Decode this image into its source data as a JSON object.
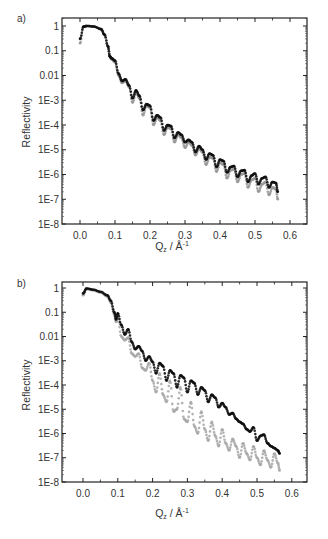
{
  "chart_data": [
    {
      "panel": "a)",
      "type": "scatter",
      "title": "",
      "xlabel": "Q_z / Å^-1",
      "ylabel": "Reflectivity",
      "yscale": "log",
      "xlim": [
        -0.05,
        0.65
      ],
      "ylim": [
        1e-08,
        1.6
      ],
      "x_ticks": [
        "0.0",
        "0.1",
        "0.2",
        "0.3",
        "0.4",
        "0.5",
        "0.6"
      ],
      "y_ticks": [
        "1",
        "0.1",
        "0.01",
        "1E-3",
        "1E-4",
        "1E-5",
        "1E-6",
        "1E-7",
        "1E-8"
      ],
      "grid": false,
      "legend": null,
      "series": [
        {
          "name": "dark series",
          "color": "#111111",
          "x": [
            0.0,
            0.01,
            0.02,
            0.04,
            0.06,
            0.07,
            0.08,
            0.085,
            0.09,
            0.1,
            0.11,
            0.12,
            0.13,
            0.14,
            0.15,
            0.16,
            0.17,
            0.18,
            0.19,
            0.2,
            0.21,
            0.22,
            0.23,
            0.24,
            0.25,
            0.26,
            0.27,
            0.28,
            0.29,
            0.3,
            0.31,
            0.32,
            0.33,
            0.34,
            0.35,
            0.36,
            0.37,
            0.38,
            0.39,
            0.4,
            0.41,
            0.42,
            0.43,
            0.44,
            0.45,
            0.46,
            0.47,
            0.48,
            0.49,
            0.5,
            0.51,
            0.52,
            0.53,
            0.54,
            0.55,
            0.56,
            0.565
          ],
          "y": [
            0.3,
            0.95,
            1.0,
            0.95,
            0.75,
            0.45,
            0.15,
            0.06,
            0.05,
            0.04,
            0.012,
            0.006,
            0.007,
            0.004,
            0.0012,
            0.0025,
            0.0015,
            0.0004,
            0.0007,
            0.0006,
            0.00015,
            0.00025,
            0.0002,
            6e-05,
            0.0001,
            9e-05,
            3e-05,
            5e-05,
            4e-05,
            2e-05,
            2.5e-05,
            2e-05,
            8e-06,
            1.4e-05,
            1e-05,
            4e-06,
            7e-06,
            6e-06,
            2e-06,
            4e-06,
            3.5e-06,
            1.2e-06,
            2e-06,
            2.2e-06,
            8e-07,
            1.4e-06,
            1.5e-06,
            5e-07,
            9e-07,
            1.1e-06,
            4e-07,
            7e-07,
            8e-07,
            3e-07,
            5e-07,
            4.5e-07,
            2e-07
          ]
        },
        {
          "name": "light series",
          "color": "#999999",
          "x": [
            0.0,
            0.01,
            0.02,
            0.04,
            0.06,
            0.07,
            0.08,
            0.085,
            0.09,
            0.1,
            0.11,
            0.12,
            0.13,
            0.14,
            0.15,
            0.16,
            0.17,
            0.18,
            0.19,
            0.2,
            0.21,
            0.22,
            0.23,
            0.24,
            0.25,
            0.26,
            0.27,
            0.28,
            0.29,
            0.3,
            0.31,
            0.32,
            0.33,
            0.34,
            0.35,
            0.36,
            0.37,
            0.38,
            0.39,
            0.4,
            0.41,
            0.42,
            0.43,
            0.44,
            0.45,
            0.46,
            0.47,
            0.48,
            0.49,
            0.5,
            0.51,
            0.52,
            0.53,
            0.54,
            0.55,
            0.56,
            0.565
          ],
          "y": [
            0.2,
            0.95,
            1.0,
            0.95,
            0.75,
            0.45,
            0.15,
            0.06,
            0.045,
            0.035,
            0.01,
            0.005,
            0.006,
            0.0035,
            0.0008,
            0.002,
            0.0012,
            0.00025,
            0.0006,
            0.0005,
            0.0001,
            0.0002,
            0.00015,
            4e-05,
            8e-05,
            7e-05,
            2e-05,
            4e-05,
            3e-05,
            1.2e-05,
            2e-05,
            1.5e-05,
            6e-06,
            1.1e-05,
            8e-06,
            2.5e-06,
            5e-06,
            4.5e-06,
            1.3e-06,
            3e-06,
            2.5e-06,
            7e-07,
            1.5e-06,
            1.6e-06,
            5e-07,
            1e-06,
            1.1e-06,
            3e-07,
            6e-07,
            7e-07,
            2e-07,
            4e-07,
            5e-07,
            1.5e-07,
            3e-07,
            2.5e-07,
            1e-07
          ]
        }
      ]
    },
    {
      "panel": "b)",
      "type": "scatter",
      "title": "",
      "xlabel": "Q_z / Å^-1",
      "ylabel": "Reflectivity",
      "yscale": "log",
      "xlim": [
        -0.05,
        0.65
      ],
      "ylim": [
        1e-08,
        1.6
      ],
      "x_ticks": [
        "0.0",
        "0.1",
        "0.2",
        "0.3",
        "0.4",
        "0.5",
        "0.6"
      ],
      "y_ticks": [
        "1",
        "0.1",
        "0.01",
        "1E-3",
        "1E-4",
        "1E-5",
        "1E-6",
        "1E-7",
        "1E-8"
      ],
      "grid": false,
      "legend": null,
      "series": [
        {
          "name": "dark series",
          "color": "#111111",
          "x": [
            0.0,
            0.01,
            0.03,
            0.05,
            0.07,
            0.08,
            0.09,
            0.095,
            0.1,
            0.11,
            0.12,
            0.13,
            0.14,
            0.15,
            0.16,
            0.17,
            0.18,
            0.19,
            0.2,
            0.21,
            0.22,
            0.23,
            0.24,
            0.25,
            0.26,
            0.27,
            0.28,
            0.29,
            0.3,
            0.31,
            0.32,
            0.33,
            0.34,
            0.35,
            0.36,
            0.37,
            0.38,
            0.39,
            0.4,
            0.41,
            0.42,
            0.43,
            0.44,
            0.45,
            0.46,
            0.47,
            0.48,
            0.49,
            0.5,
            0.51,
            0.52,
            0.53,
            0.54,
            0.55,
            0.56,
            0.565
          ],
          "y": [
            0.6,
            0.95,
            0.85,
            0.7,
            0.5,
            0.3,
            0.1,
            0.05,
            0.09,
            0.03,
            0.012,
            0.02,
            0.006,
            0.003,
            0.004,
            0.0025,
            0.001,
            0.0015,
            0.0009,
            0.0003,
            0.0008,
            0.0006,
            0.00015,
            0.0004,
            0.0003,
            8e-05,
            0.00025,
            0.0002,
            5e-05,
            0.00015,
            0.00012,
            4e-05,
            8e-05,
            6e-05,
            2e-05,
            4e-05,
            3e-05,
            1.2e-05,
            1.8e-05,
            1.2e-05,
            6e-06,
            7e-06,
            4e-06,
            3e-06,
            2.5e-06,
            1.5e-06,
            1.2e-06,
            1.8e-06,
            5e-07,
            8e-07,
            9e-07,
            4e-07,
            3e-07,
            2.5e-07,
            2e-07,
            1.5e-07
          ]
        },
        {
          "name": "light series",
          "color": "#aaaaaa",
          "x": [
            0.0,
            0.01,
            0.03,
            0.05,
            0.07,
            0.08,
            0.09,
            0.095,
            0.1,
            0.11,
            0.12,
            0.13,
            0.14,
            0.15,
            0.16,
            0.17,
            0.18,
            0.19,
            0.2,
            0.21,
            0.22,
            0.23,
            0.24,
            0.25,
            0.26,
            0.27,
            0.28,
            0.29,
            0.3,
            0.31,
            0.32,
            0.33,
            0.34,
            0.35,
            0.36,
            0.37,
            0.38,
            0.39,
            0.4,
            0.41,
            0.42,
            0.43,
            0.44,
            0.45,
            0.46,
            0.47,
            0.48,
            0.49,
            0.5,
            0.51,
            0.52,
            0.53,
            0.54,
            0.55,
            0.56,
            0.565
          ],
          "y": [
            0.5,
            0.9,
            0.8,
            0.65,
            0.45,
            0.25,
            0.08,
            0.04,
            0.06,
            0.01,
            0.007,
            0.009,
            0.002,
            0.0015,
            0.002,
            0.0005,
            0.0004,
            0.0008,
            0.00015,
            5e-05,
            0.0003,
            4e-05,
            2e-05,
            0.00015,
            8e-06,
            1e-05,
            8e-05,
            4e-06,
            3e-06,
            2e-05,
            2e-06,
            1e-06,
            8e-06,
            1.5e-06,
            5e-07,
            3e-06,
            8e-07,
            3e-07,
            1.5e-06,
            4e-07,
            2e-07,
            6e-07,
            3e-07,
            1e-07,
            4e-07,
            1.5e-07,
            8e-08,
            3e-07,
            1e-07,
            5e-08,
            2e-07,
            8e-08,
            4e-08,
            1.5e-07,
            6e-08,
            3e-08
          ]
        }
      ]
    }
  ],
  "panels": [
    {
      "label": "a)",
      "ylabel": "Reflectivity",
      "xlabel_main": "Q",
      "xlabel_sub": "z",
      "xlabel_rest": " / Å",
      "xlabel_sup": "-1",
      "y_ticks": [
        "1",
        "0.1",
        "0.01",
        "1E-3",
        "1E-4",
        "1E-5",
        "1E-6",
        "1E-7",
        "1E-8"
      ],
      "x_ticks": [
        "0.0",
        "0.1",
        "0.2",
        "0.3",
        "0.4",
        "0.5",
        "0.6"
      ]
    },
    {
      "label": "b)",
      "ylabel": "Reflectivity",
      "xlabel_main": "Q",
      "xlabel_sub": "z",
      "xlabel_rest": " / Å",
      "xlabel_sup": "-1",
      "y_ticks": [
        "1",
        "0.1",
        "0.01",
        "1E-3",
        "1E-4",
        "1E-5",
        "1E-6",
        "1E-7",
        "1E-8"
      ],
      "x_ticks": [
        "0.0",
        "0.1",
        "0.2",
        "0.3",
        "0.4",
        "0.5",
        "0.6"
      ]
    }
  ]
}
